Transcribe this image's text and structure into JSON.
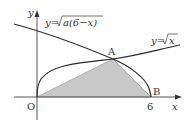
{
  "diagram": {
    "axes": {
      "x_label": "x",
      "y_label": "y",
      "origin_label": "O"
    },
    "curves": [
      {
        "name": "upper-curve",
        "equation": "y=√(a(6−x))",
        "label_prefix": "y=",
        "label_root": "a(6−x)"
      },
      {
        "name": "lower-curve",
        "equation": "y=√x",
        "label_prefix": "y=",
        "label_root": "x"
      }
    ],
    "points": [
      {
        "name": "A",
        "label": "A"
      },
      {
        "name": "B",
        "label": "B"
      }
    ],
    "ticks": {
      "b_tick": "6"
    },
    "shaded_region": "triangle OAB",
    "colors": {
      "line": "#2b2b2b",
      "axis": "#555555",
      "fill": "#c8c8c8"
    }
  }
}
